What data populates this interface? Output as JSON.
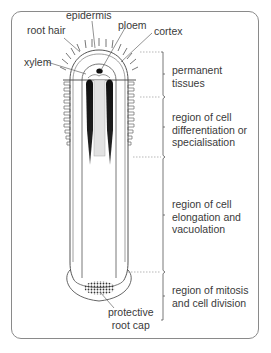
{
  "diagram": {
    "structure_labels": {
      "epidermis": "epidermis",
      "root_hair": "root hair",
      "ploem": "ploem",
      "cortex": "cortex",
      "xylem": "xylem",
      "root_cap": "protective\nroot cap"
    },
    "regions": [
      {
        "id": "permanent",
        "label": "permanent\ntissues"
      },
      {
        "id": "differentiation",
        "label": "region of cell\ndifferentiation or\nspecialisation"
      },
      {
        "id": "elongation",
        "label": "region of cell\nelongation and\nvacuolation"
      },
      {
        "id": "mitosis",
        "label": "region of mitosis\nand cell division"
      }
    ],
    "colors": {
      "line": "#555555",
      "xylem": "#1a1a1a",
      "phloem_fill": "#e2e2e2",
      "frame": "#8a8a8a",
      "dashed": "#9a9a9a"
    }
  }
}
